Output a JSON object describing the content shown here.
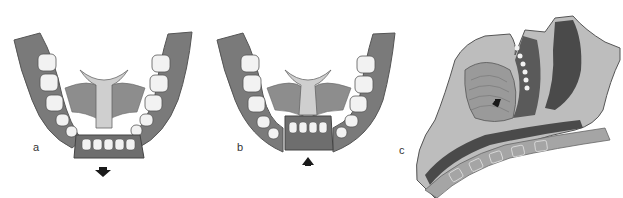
{
  "figure": {
    "panels": [
      {
        "id": "a",
        "label": "a",
        "arrow": "down",
        "subject": "mandible occlusal view, anterior segment displaced downward"
      },
      {
        "id": "b",
        "label": "b",
        "arrow": "up",
        "subject": "mandible occlusal view, anterior segment repositioned upward"
      },
      {
        "id": "c",
        "label": "c",
        "arrow": "down",
        "subject": "sagittal section of head and neck, tongue and airway"
      }
    ],
    "colors": {
      "gum": "#7a7a7a",
      "gum_dark": "#5e5e5e",
      "tooth": "#f2f2f2",
      "muscle": "#8d8d8d",
      "tissue_light": "#bdbdbd",
      "tissue_dark": "#4a4a4a",
      "arrow": "#1a1a1a"
    }
  }
}
